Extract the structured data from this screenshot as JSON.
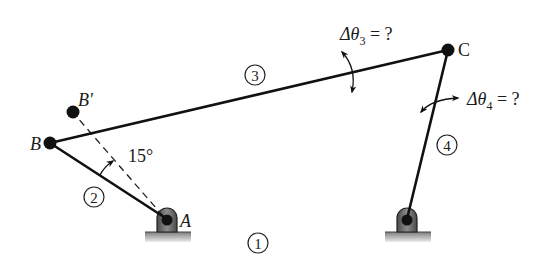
{
  "diagram": {
    "type": "four-bar linkage",
    "points": {
      "A": {
        "label": "A",
        "x": 167,
        "y": 220
      },
      "B": {
        "label": "B",
        "x": 50,
        "y": 143
      },
      "B_prime": {
        "label": "B′",
        "x": 73,
        "y": 112
      },
      "C": {
        "label": "C",
        "x": 448,
        "y": 50
      },
      "D": {
        "label": "",
        "x": 407,
        "y": 220
      }
    },
    "link_labels": {
      "link1": "1",
      "link2": "2",
      "link3": "3",
      "link4": "4"
    },
    "annotations": {
      "input_angle": "15°",
      "delta_theta3": {
        "symbol": "Δθ",
        "subscript": "3",
        "rhs": " = ?"
      },
      "delta_theta4": {
        "symbol": "Δθ",
        "subscript": "4",
        "rhs": " = ?"
      }
    },
    "colors": {
      "ink": "#111111",
      "ground_top": "#8a8a8a",
      "ground_bottom": "#e6e6e6",
      "pivot_body": "#6b6b6b"
    }
  }
}
